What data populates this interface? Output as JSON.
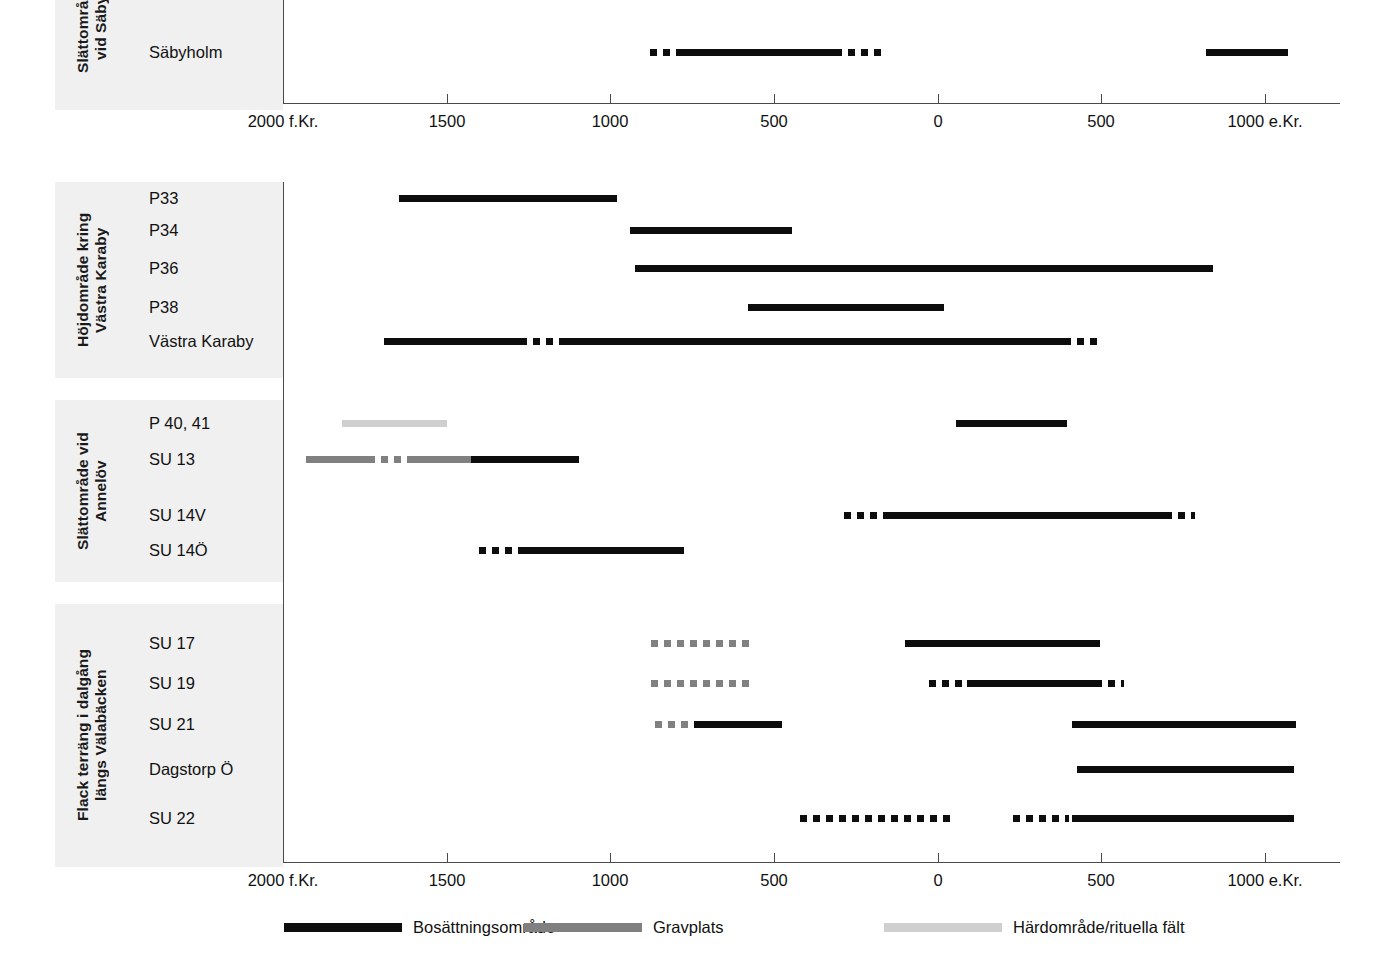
{
  "chart_data": {
    "type": "bar",
    "title": "",
    "xlabel": "",
    "ylabel": "",
    "orientation": "horizontal-timeline",
    "xlim": [
      -2000,
      1100
    ],
    "grid": false,
    "axis": {
      "ticks": [
        {
          "value": -2000,
          "label": "2000 f.Kr.",
          "x": 283
        },
        {
          "value": -1500,
          "label": "1500",
          "x": 447
        },
        {
          "value": -1000,
          "label": "1000",
          "x": 610
        },
        {
          "value": -500,
          "label": "500",
          "x": 774
        },
        {
          "value": 0,
          "label": "0",
          "x": 938
        },
        {
          "value": 500,
          "label": "500",
          "x": 1101
        },
        {
          "value": 1000,
          "label": "1000 e.Kr.",
          "x": 1265
        }
      ]
    },
    "legend": {
      "position": "bottom",
      "entries": [
        {
          "key": "settle",
          "label": "Bosättningsområde",
          "color": "#0d0d0d"
        },
        {
          "key": "grave",
          "label": "Gravplats",
          "color": "#808080"
        },
        {
          "key": "hearth",
          "label": "Härdområde/rituella fält",
          "color": "#cfcfcf"
        }
      ]
    },
    "groups": [
      {
        "id": "saby",
        "title": "Slättområde\nvid Säby",
        "rows": [
          {
            "label": "Säbyholm",
            "segments": [
              {
                "type": "settle",
                "style": "dashed",
                "from": -880,
                "to": -800
              },
              {
                "type": "settle",
                "style": "solid",
                "from": -800,
                "to": -315
              },
              {
                "type": "settle",
                "style": "dashed",
                "from": -315,
                "to": -170
              },
              {
                "type": "settle",
                "style": "solid",
                "from": 820,
                "to": 1070
              }
            ]
          }
        ]
      },
      {
        "id": "vastra-karaby",
        "title": "Höjdområde kring\nVästra Karaby",
        "rows": [
          {
            "label": "P33",
            "segments": [
              {
                "type": "settle",
                "style": "solid",
                "from": -1645,
                "to": -980
              }
            ]
          },
          {
            "label": "P34",
            "segments": [
              {
                "type": "settle",
                "style": "solid",
                "from": -940,
                "to": -445
              }
            ]
          },
          {
            "label": "P36",
            "segments": [
              {
                "type": "settle",
                "style": "solid",
                "from": -925,
                "to": 500
              },
              {
                "type": "settle",
                "style": "dashed",
                "from": 500,
                "to": 520
              },
              {
                "type": "settle",
                "style": "solid",
                "from": 520,
                "to": 840
              }
            ]
          },
          {
            "label": "P38",
            "segments": [
              {
                "type": "settle",
                "style": "solid",
                "from": -580,
                "to": 20
              }
            ]
          },
          {
            "label": "Västra Karaby",
            "segments": [
              {
                "type": "settle",
                "style": "solid",
                "from": -1690,
                "to": -1275
              },
              {
                "type": "settle",
                "style": "dashed",
                "from": -1275,
                "to": -1150
              },
              {
                "type": "settle",
                "style": "solid",
                "from": -1150,
                "to": 385
              },
              {
                "type": "settle",
                "style": "dashed",
                "from": 385,
                "to": 490
              }
            ]
          }
        ]
      },
      {
        "id": "annelov",
        "title": "Slättområde vid\nAnnelöv",
        "rows": [
          {
            "label": "P 40, 41",
            "segments": [
              {
                "type": "hearth",
                "style": "solid",
                "from": -1820,
                "to": -1500
              },
              {
                "type": "settle",
                "style": "solid",
                "from": 55,
                "to": 395
              }
            ]
          },
          {
            "label": "SU 13",
            "segments": [
              {
                "type": "grave",
                "style": "solid",
                "from": -1930,
                "to": -1740
              },
              {
                "type": "grave",
                "style": "dashed",
                "from": -1740,
                "to": -1610
              },
              {
                "type": "grave",
                "style": "solid",
                "from": -1610,
                "to": -1255
              },
              {
                "type": "settle",
                "style": "solid",
                "from": -1425,
                "to": -1095
              }
            ]
          },
          {
            "label": "SU 14V",
            "segments": [
              {
                "type": "settle",
                "style": "dashed",
                "from": -285,
                "to": -155
              },
              {
                "type": "settle",
                "style": "solid",
                "from": -155,
                "to": 695
              },
              {
                "type": "settle",
                "style": "dashed",
                "from": 695,
                "to": 785
              }
            ]
          },
          {
            "label": "SU 14Ö",
            "segments": [
              {
                "type": "settle",
                "style": "dashed",
                "from": -1400,
                "to": -1270
              },
              {
                "type": "settle",
                "style": "solid",
                "from": -1270,
                "to": -775
              }
            ]
          }
        ]
      },
      {
        "id": "valabacken",
        "title": "Flack terräng i dalgång\nlängs Välabäcken",
        "rows": [
          {
            "label": "SU 17",
            "segments": [
              {
                "type": "grave",
                "style": "dashed",
                "from": -875,
                "to": -560
              },
              {
                "type": "settle",
                "style": "solid",
                "from": -100,
                "to": 495
              }
            ]
          },
          {
            "label": "SU 19",
            "segments": [
              {
                "type": "grave",
                "style": "dashed",
                "from": -875,
                "to": -560
              },
              {
                "type": "settle",
                "style": "dashed",
                "from": -25,
                "to": 90
              },
              {
                "type": "settle",
                "style": "solid",
                "from": 90,
                "to": 480
              },
              {
                "type": "settle",
                "style": "dashed",
                "from": 480,
                "to": 570
              }
            ]
          },
          {
            "label": "SU 21",
            "segments": [
              {
                "type": "grave",
                "style": "dashed",
                "from": -865,
                "to": -580
              },
              {
                "type": "settle",
                "style": "solid",
                "from": -745,
                "to": -475
              },
              {
                "type": "settle",
                "style": "solid",
                "from": 410,
                "to": 1095
              }
            ]
          },
          {
            "label": "Dagstorp Ö",
            "segments": [
              {
                "type": "settle",
                "style": "solid",
                "from": 425,
                "to": 1090
              }
            ]
          },
          {
            "label": "SU 22",
            "segments": [
              {
                "type": "settle",
                "style": "dashed",
                "from": -420,
                "to": 55
              },
              {
                "type": "settle",
                "style": "dashed",
                "from": 230,
                "to": 400
              },
              {
                "type": "settle",
                "style": "solid",
                "from": 410,
                "to": 1090
              }
            ]
          }
        ]
      }
    ]
  },
  "layout": {
    "plot_left_x": 283,
    "plot_right_x": 1320,
    "px_per_year": 0.3272,
    "bands": [
      {
        "id": "saby",
        "top": -60,
        "height": 170,
        "label_top": -55,
        "label_h": 165
      },
      {
        "id": "vastra-karaby",
        "top": 182,
        "height": 196,
        "label_top": 182,
        "label_h": 196
      },
      {
        "id": "annelov",
        "top": 400,
        "height": 182,
        "label_top": 400,
        "label_h": 182
      },
      {
        "id": "valabacken",
        "top": 604,
        "height": 263,
        "label_top": 604,
        "label_h": 263
      }
    ],
    "axes": [
      {
        "id": "axis-top",
        "y": 103,
        "x1": 283,
        "x2": 1340,
        "vline_top": -30,
        "vline_bottom": 103
      },
      {
        "id": "axis-bottom",
        "y": 862,
        "x1": 283,
        "x2": 1340,
        "vline_top": 182,
        "vline_bottom": 862
      }
    ],
    "rows_y": {
      "saby": [
        52
      ],
      "vastra-karaby": [
        198,
        230,
        268,
        307,
        341
      ],
      "annelov": [
        423,
        459,
        515,
        550
      ],
      "valabacken": [
        643,
        683,
        724,
        769,
        818
      ]
    }
  }
}
